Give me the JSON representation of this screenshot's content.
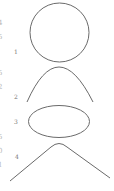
{
  "diagram": {
    "title": "",
    "stroke_color": "#6a6a6a",
    "edge_marks": [
      {
        "text": "4",
        "y": 23
      },
      {
        "text": "5",
        "y": 37
      },
      {
        "text": "5",
        "y": 73
      },
      {
        "text": "2",
        "y": 87
      },
      {
        "text": "5",
        "y": 137
      },
      {
        "text": "0",
        "y": 151
      },
      {
        "text": "1",
        "y": 165
      }
    ],
    "shapes": [
      {
        "label": "1",
        "kind": "circle"
      },
      {
        "label": "2",
        "kind": "parabola"
      },
      {
        "label": "3",
        "kind": "ellipse"
      },
      {
        "label": "4",
        "kind": "hyperbola-branch"
      }
    ]
  }
}
